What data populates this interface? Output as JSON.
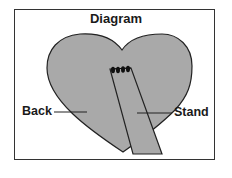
{
  "diagram": {
    "title": "Diagram",
    "labels": {
      "back": "Back",
      "stand": "Stand"
    },
    "colors": {
      "fill": "#a9a9a9",
      "stroke": "#222222",
      "border": "#333333",
      "background": "#ffffff"
    },
    "parts": [
      "heart-shaped back",
      "rectangular stand",
      "hinge stitches"
    ]
  }
}
